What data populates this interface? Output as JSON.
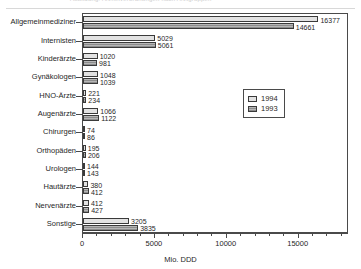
{
  "header": {
    "faded_text": "Abbildung: Arzneiverordnungen nach Arztgruppen"
  },
  "chart_data": {
    "type": "bar",
    "orientation": "horizontal",
    "title": "",
    "xlabel": "Mio. DDD",
    "ylabel": "",
    "xlim": [
      0,
      18500
    ],
    "xticks": [
      0,
      5000,
      10000,
      15000
    ],
    "xtick_labels": [
      "0",
      "5000",
      "10000",
      "15000"
    ],
    "grid": false,
    "legend_position": "center-right",
    "categories": [
      "Allgemeinmediziner",
      "Internisten",
      "Kinderärzte",
      "Gynäkologen",
      "HNO-Ärzte",
      "Augenärzte",
      "Chirurgen",
      "Orthopäden",
      "Urologen",
      "Hautärzte",
      "Nervenärzte",
      "Sonstige"
    ],
    "series": [
      {
        "name": "1994",
        "values": [
          16377,
          5029,
          1020,
          1048,
          221,
          1066,
          74,
          195,
          144,
          380,
          412,
          3205
        ]
      },
      {
        "name": "1993",
        "values": [
          14661,
          5061,
          981,
          1039,
          234,
          1122,
          86,
          206,
          143,
          412,
          427,
          3835
        ]
      }
    ]
  },
  "legend": {
    "entries": [
      {
        "label": "1994",
        "color": "#e2e2e2"
      },
      {
        "label": "1993",
        "color": "#9a9a9a"
      }
    ]
  }
}
